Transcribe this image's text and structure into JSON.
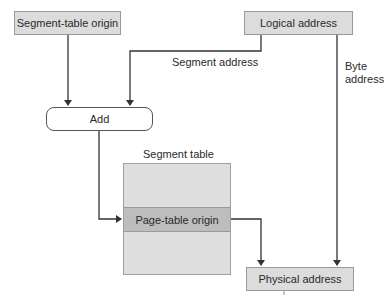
{
  "nodes": {
    "segment_table_origin": "Segment-table origin",
    "logical_address": "Logical address",
    "add": "Add",
    "segment_table_title": "Segment table",
    "page_table_origin": "Page-table origin",
    "physical_address": "Physical address"
  },
  "edge_labels": {
    "segment_address": "Segment address",
    "byte_address_line1": "Byte",
    "byte_address_line2": "address"
  },
  "colors": {
    "box_fill": "#dcdcdc",
    "row_fill": "#bdbdbd",
    "line": "#333333"
  }
}
